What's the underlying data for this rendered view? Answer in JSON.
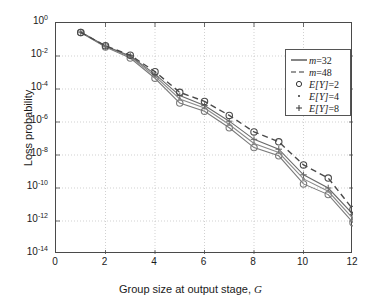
{
  "axes": {
    "xlabel_pre": "Group size at output stage, ",
    "xlabel_var": "G",
    "ylabel": "Loss probability",
    "xticks": [
      "0",
      "2",
      "4",
      "6",
      "8",
      "10",
      "12"
    ],
    "yticks": [
      "0",
      "-2",
      "-4",
      "-6",
      "-8",
      "-10",
      "-12",
      "-14"
    ],
    "ybase": "10"
  },
  "legend": {
    "items": [
      {
        "symbol": "solid-line",
        "text_pre": "m",
        "text_post": "=32"
      },
      {
        "symbol": "dashed-line",
        "text_pre": "m",
        "text_post": "=48"
      },
      {
        "symbol": "circle-marker",
        "text_pre": "E[Y]",
        "text_post": "=2"
      },
      {
        "symbol": "dot-marker",
        "text_pre": "E[Y]",
        "text_post": "=4"
      },
      {
        "symbol": "plus-marker",
        "text_pre": "E[Y]",
        "text_post": "=8"
      }
    ]
  },
  "chart_data": {
    "type": "line",
    "title": "",
    "xlabel": "Group size at output stage, G",
    "ylabel": "Loss probability",
    "xlim": [
      0,
      12
    ],
    "ylim_log10": [
      -14,
      0
    ],
    "yscale": "log",
    "grid": true,
    "legend_position": "upper-right",
    "x": [
      1,
      2,
      3,
      4,
      5,
      6,
      7,
      8,
      9,
      10,
      11,
      12
    ],
    "series": [
      {
        "name": "m=32, E[Y]=2",
        "line": "solid",
        "marker": "circle",
        "color": "#7a7a7a",
        "values_log10": [
          -0.58,
          -1.45,
          -2.12,
          -3.35,
          -4.85,
          -5.35,
          -6.35,
          -7.55,
          -8.05,
          -9.75,
          -10.4,
          -12.1
        ],
        "values": [
          0.26,
          0.035,
          0.0076,
          0.00045,
          1.4e-05,
          4.5e-06,
          4.5e-07,
          2.8e-08,
          8.9e-09,
          1.8e-10,
          4e-11,
          7.9e-13
        ]
      },
      {
        "name": "m=32, E[Y]=4",
        "line": "solid",
        "marker": "dot",
        "color": "#8a8a8a",
        "values_log10": [
          -0.56,
          -1.42,
          -2.05,
          -3.22,
          -4.6,
          -5.15,
          -6.15,
          -7.3,
          -7.85,
          -9.45,
          -10.2,
          -11.85
        ],
        "values": [
          0.28,
          0.038,
          0.0089,
          0.0006,
          2.5e-05,
          7.1e-06,
          7.1e-07,
          5e-08,
          1.4e-08,
          3.5e-10,
          6.3e-11,
          1.4e-12
        ]
      },
      {
        "name": "m=32, E[Y]=8",
        "line": "solid",
        "marker": "plus",
        "color": "#6a6a6a",
        "values_log10": [
          -0.55,
          -1.4,
          -2.0,
          -3.1,
          -4.4,
          -5.0,
          -5.95,
          -7.05,
          -7.65,
          -9.2,
          -10.0,
          -11.6
        ],
        "values": [
          0.28,
          0.04,
          0.01,
          0.00079,
          4e-05,
          1e-05,
          1.1e-06,
          8.9e-08,
          2.2e-08,
          6.3e-10,
          1e-10,
          2.5e-12
        ]
      },
      {
        "name": "m=48, E[Y]=2",
        "line": "dashed",
        "marker": "circle",
        "color": "#4a4a4a",
        "values_log10": [
          -0.57,
          -1.38,
          -1.95,
          -2.95,
          -4.2,
          -4.75,
          -5.6,
          -6.6,
          -7.2,
          -8.6,
          -9.4,
          -11.3
        ],
        "values": [
          0.27,
          0.042,
          0.011,
          0.0011,
          6.3e-05,
          1.8e-05,
          2.5e-06,
          2.5e-07,
          6.3e-08,
          2.5e-09,
          4e-10,
          5e-12
        ]
      }
    ]
  }
}
